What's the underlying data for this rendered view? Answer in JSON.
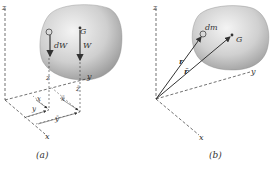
{
  "figure": {
    "panel_a": {
      "caption": "(a)",
      "axes": {
        "x": "x",
        "y": "y",
        "z": "z"
      },
      "labels": {
        "element_weight": "dW",
        "center_of_gravity": "G",
        "total_weight": "W",
        "elem_z": "z",
        "bar_z": "z̄",
        "elem_x": "x",
        "bar_x": "x̄",
        "elem_y": "y",
        "bar_y": "ȳ"
      }
    },
    "panel_b": {
      "caption": "(b)",
      "axes": {
        "x": "x",
        "y": "y",
        "z": "z"
      },
      "labels": {
        "mass_element": "dm",
        "center_of_mass": "G",
        "position_vector": "r",
        "mean_position_vector": "r̄"
      }
    },
    "colors": {
      "body_fill": "#c8c8c8",
      "line": "#333333",
      "background": "#ffffff"
    }
  }
}
